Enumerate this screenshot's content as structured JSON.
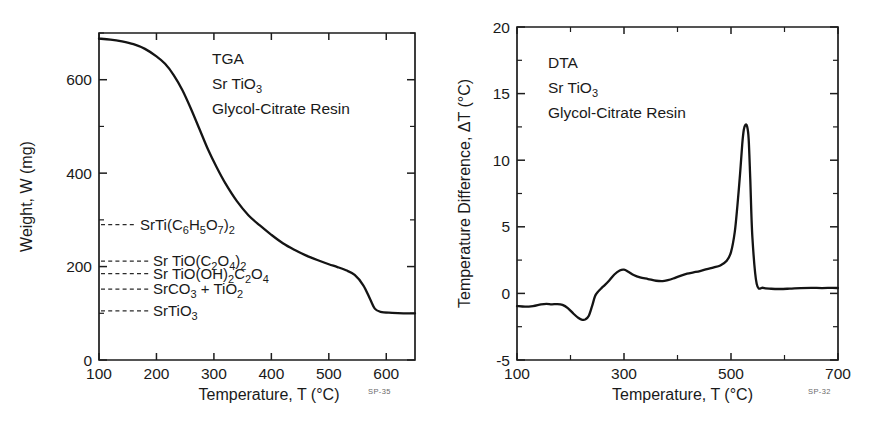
{
  "figure": {
    "name": "tga-dta-srtio3-figure",
    "background": "#ffffff",
    "ink_color": "#141414"
  },
  "panels": [
    {
      "id": "tga",
      "corner_code": "SP-35",
      "annotation_lines": [
        "TGA",
        "Sr TiO3",
        "Glycol-Citrate Resin"
      ],
      "annotation_rich": [
        {
          "runs": [
            {
              "t": "TGA",
              "sub": false
            }
          ]
        },
        {
          "runs": [
            {
              "t": "Sr TiO",
              "sub": false
            },
            {
              "t": "3",
              "sub": true
            }
          ]
        },
        {
          "runs": [
            {
              "t": "Glycol-Citrate Resin",
              "sub": false
            }
          ]
        }
      ],
      "xlabel_runs": [
        {
          "t": "Temperature, T  (°C)",
          "sub": false
        }
      ],
      "xlabel": "Temperature, T  (°C)",
      "ylabel": "Weight, W  (mg)",
      "xlim": [
        100,
        650
      ],
      "ylim": [
        0,
        700
      ],
      "xticks": [
        100,
        200,
        300,
        400,
        500,
        600
      ],
      "xticklabels": [
        "100",
        "200",
        "300",
        "400",
        "500",
        "600"
      ],
      "xminorticks": [
        150,
        250,
        350,
        450,
        550,
        650
      ],
      "yticks": [
        0,
        200,
        400,
        600
      ],
      "yticklabels": [
        "0",
        "200",
        "400",
        "600"
      ],
      "yminorticks": [
        100,
        300,
        500,
        700
      ],
      "species_labels": [
        {
          "id": "citrate",
          "text": "SrTi(C6H5O7)2",
          "runs": [
            {
              "t": "SrTi(C",
              "sub": false
            },
            {
              "t": "6",
              "sub": true
            },
            {
              "t": "H",
              "sub": false
            },
            {
              "t": "5",
              "sub": true
            },
            {
              "t": "O",
              "sub": false
            },
            {
              "t": "7",
              "sub": true
            },
            {
              "t": ")",
              "sub": false
            },
            {
              "t": "2",
              "sub": true
            }
          ],
          "weight_mg": 290,
          "text_x": 140,
          "leader_from_x": 101,
          "leader_to_x": 137
        },
        {
          "id": "oxalate",
          "text": "Sr TiO(C2O4)2",
          "runs": [
            {
              "t": "Sr TiO(C",
              "sub": false
            },
            {
              "t": "2",
              "sub": true
            },
            {
              "t": "O",
              "sub": false
            },
            {
              "t": "4",
              "sub": true
            },
            {
              "t": ")",
              "sub": false
            },
            {
              "t": "2",
              "sub": true
            }
          ],
          "weight_mg": 212,
          "text_x": 153,
          "leader_from_x": 101,
          "leader_to_x": 150
        },
        {
          "id": "hydroxy-oxalate",
          "text": "Sr TiO(OH)2C2O4",
          "runs": [
            {
              "t": "Sr TiO(OH)",
              "sub": false
            },
            {
              "t": "2",
              "sub": true
            },
            {
              "t": "C",
              "sub": false
            },
            {
              "t": "2",
              "sub": true
            },
            {
              "t": "O",
              "sub": false
            },
            {
              "t": "4",
              "sub": true
            }
          ],
          "weight_mg": 185,
          "text_x": 153,
          "leader_from_x": 101,
          "leader_to_x": 150
        },
        {
          "id": "carbonate-titania",
          "text": "SrCO3 + TiO2",
          "runs": [
            {
              "t": "SrCO",
              "sub": false
            },
            {
              "t": "3",
              "sub": true
            },
            {
              "t": " + TiO",
              "sub": false
            },
            {
              "t": "2",
              "sub": true
            }
          ],
          "weight_mg": 152,
          "text_x": 153,
          "leader_from_x": 101,
          "leader_to_x": 150
        },
        {
          "id": "strontium-titanate",
          "text": "SrTiO3",
          "runs": [
            {
              "t": "SrTiO",
              "sub": false
            },
            {
              "t": "3",
              "sub": true
            }
          ],
          "weight_mg": 105,
          "text_x": 153,
          "leader_from_x": 101,
          "leader_to_x": 150
        }
      ]
    },
    {
      "id": "dta",
      "corner_code": "SP-32",
      "annotation_lines": [
        "DTA",
        "Sr TiO3",
        "Glycol-Citrate Resin"
      ],
      "annotation_rich": [
        {
          "runs": [
            {
              "t": "DTA",
              "sub": false
            }
          ]
        },
        {
          "runs": [
            {
              "t": "Sr TiO",
              "sub": false
            },
            {
              "t": "3",
              "sub": true
            }
          ]
        },
        {
          "runs": [
            {
              "t": "Glycol-Citrate Resin",
              "sub": false
            }
          ]
        }
      ],
      "xlabel": "Temperature, T  (°C)",
      "ylabel": "Temperature Difference, ΔT  (°C)",
      "xlim": [
        100,
        700
      ],
      "ylim": [
        -5,
        20
      ],
      "xticks": [
        100,
        300,
        500,
        700
      ],
      "xticklabels": [
        "100",
        "300",
        "500",
        "700"
      ],
      "xminorticks": [
        200,
        400,
        600
      ],
      "yticks": [
        -5,
        0,
        5,
        10,
        15,
        20
      ],
      "yticklabels": [
        "-5",
        "0",
        "5",
        "10",
        "15",
        "20"
      ],
      "yminorticks": [
        -2.5,
        2.5,
        7.5,
        12.5,
        17.5
      ]
    }
  ],
  "chart_data": [
    {
      "type": "line",
      "id": "tga-curve",
      "title": "TGA Sr TiO3 Glycol-Citrate Resin",
      "xlabel": "Temperature, T  (°C)",
      "ylabel": "Weight, W  (mg)",
      "xlim": [
        100,
        650
      ],
      "ylim": [
        0,
        700
      ],
      "grid": false,
      "legend": "none",
      "series": [
        {
          "name": "Weight",
          "x": [
            100,
            120,
            140,
            160,
            180,
            200,
            215,
            230,
            245,
            260,
            275,
            290,
            305,
            320,
            340,
            360,
            380,
            400,
            420,
            440,
            460,
            480,
            500,
            515,
            530,
            545,
            560,
            572,
            580,
            590,
            610,
            630,
            650
          ],
          "y": [
            688,
            686,
            682,
            676,
            666,
            650,
            634,
            610,
            578,
            538,
            494,
            450,
            412,
            378,
            340,
            310,
            288,
            268,
            250,
            236,
            224,
            214,
            205,
            199,
            192,
            182,
            160,
            130,
            110,
            103,
            101,
            100,
            100
          ]
        }
      ]
    },
    {
      "type": "line",
      "id": "dta-curve",
      "title": "DTA Sr TiO3 Glycol-Citrate Resin",
      "xlabel": "Temperature, T  (°C)",
      "ylabel": "Temperature Difference, ΔT  (°C)",
      "xlim": [
        100,
        700
      ],
      "ylim": [
        -5,
        20
      ],
      "grid": false,
      "legend": "none",
      "series": [
        {
          "name": "Delta T",
          "x": [
            100,
            115,
            130,
            145,
            155,
            165,
            175,
            185,
            195,
            205,
            215,
            222,
            228,
            234,
            240,
            246,
            252,
            258,
            264,
            272,
            282,
            292,
            300,
            308,
            318,
            330,
            345,
            360,
            372,
            382,
            392,
            404,
            418,
            430,
            442,
            455,
            468,
            480,
            492,
            500,
            507,
            512,
            517,
            521,
            524,
            527,
            530,
            533,
            536,
            540,
            548,
            560,
            575,
            592,
            610,
            630,
            650,
            670,
            690,
            700
          ],
          "y": [
            -0.95,
            -1.0,
            -0.95,
            -0.82,
            -0.78,
            -0.82,
            -0.8,
            -0.86,
            -1.1,
            -1.5,
            -1.85,
            -1.98,
            -1.95,
            -1.7,
            -1.0,
            -0.2,
            0.15,
            0.4,
            0.62,
            0.95,
            1.42,
            1.72,
            1.78,
            1.62,
            1.38,
            1.2,
            1.08,
            0.95,
            0.92,
            1.0,
            1.12,
            1.3,
            1.48,
            1.58,
            1.68,
            1.82,
            1.95,
            2.1,
            2.45,
            3.1,
            4.6,
            6.6,
            9.0,
            11.2,
            12.3,
            12.65,
            12.55,
            11.6,
            8.6,
            4.2,
            0.72,
            0.42,
            0.35,
            0.33,
            0.36,
            0.4,
            0.42,
            0.4,
            0.42,
            0.4
          ]
        }
      ]
    }
  ]
}
